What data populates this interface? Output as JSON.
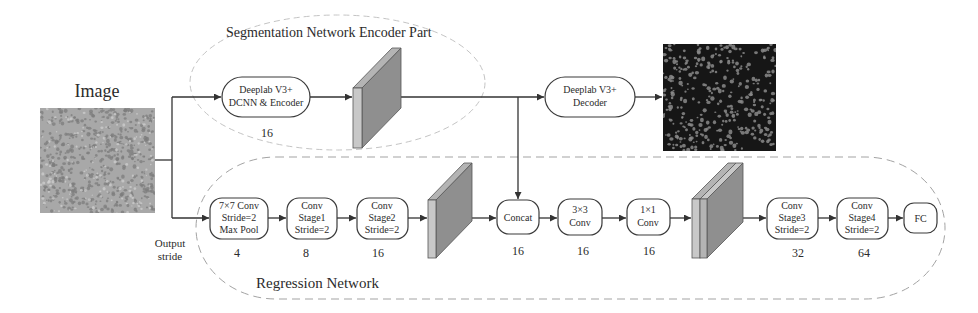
{
  "image_label": "Image",
  "output_stride_label": {
    "line1": "Output",
    "line2": "stride"
  },
  "segmentation": {
    "title": "Segmentation Network Encoder Part",
    "encoder": {
      "lines": [
        "Deeplab V3+",
        "DCNN & Encoder"
      ],
      "stride": "16"
    },
    "decoder": {
      "lines": [
        "Deeplab V3+",
        "Decoder"
      ]
    }
  },
  "regression": {
    "title": "Regression Network",
    "blocks": [
      {
        "id": "conv7x7",
        "lines": [
          "7×7 Conv",
          "Stride=2",
          "Max Pool"
        ],
        "stride": "4"
      },
      {
        "id": "stage1",
        "lines": [
          "Conv",
          "Stage1",
          "Stride=2"
        ],
        "stride": "8"
      },
      {
        "id": "stage2",
        "lines": [
          "Conv",
          "Stage2",
          "Stride=2"
        ],
        "stride": "16"
      },
      {
        "id": "concat",
        "lines": [
          "Concat"
        ],
        "stride": "16"
      },
      {
        "id": "conv3x3",
        "lines": [
          "3×3",
          "Conv"
        ],
        "stride": "16"
      },
      {
        "id": "conv1x1",
        "lines": [
          "1×1",
          "Conv"
        ],
        "stride": "16"
      },
      {
        "id": "stage3",
        "lines": [
          "Conv",
          "Stage3",
          "Stride=2"
        ],
        "stride": "32"
      },
      {
        "id": "stage4",
        "lines": [
          "Conv",
          "Stage4",
          "Stride=2"
        ],
        "stride": "64"
      },
      {
        "id": "fc",
        "lines": [
          "FC"
        ]
      }
    ]
  },
  "colors": {
    "seg_region_dash": "#c4c4c4",
    "reg_region_dash": "#a3a3a3",
    "block_front": "#c8c8c8",
    "block_top": "#b4b4b4",
    "block_side": "#8f8f8f",
    "histology_bg": "#a8a8a8",
    "histology_cells": "#7c7c7c",
    "seg_bg": "#161616",
    "seg_cells": "#8a8a8a"
  }
}
